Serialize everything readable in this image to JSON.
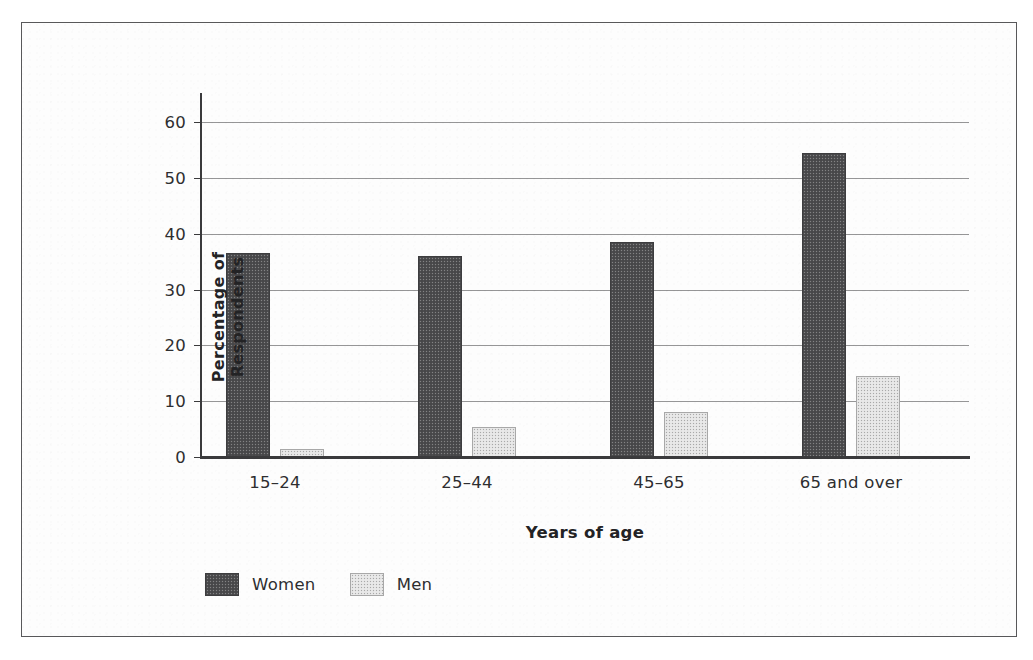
{
  "chart_data": {
    "type": "bar",
    "title": "",
    "subtitle": "",
    "xlabel": "Years of age",
    "ylabel": "Percentage of Respondents",
    "categories": [
      "15–24",
      "25–44",
      "45–65",
      "65 and over"
    ],
    "series": [
      {
        "name": "Women",
        "values": [
          36.5,
          36.0,
          38.5,
          54.5
        ],
        "color": "#4d4d4f"
      },
      {
        "name": "Men",
        "values": [
          1.5,
          5.3,
          8.0,
          14.5
        ],
        "color": "#e4e4e4"
      }
    ],
    "ylim": [
      0,
      60
    ],
    "yticks": [
      0,
      10,
      20,
      30,
      40,
      50,
      60
    ],
    "ytick_labels": [
      "0",
      "10",
      "20",
      "30",
      "40",
      "50",
      "60"
    ],
    "grid": "horizontal",
    "legend_position": "bottom-left",
    "legend": [
      {
        "label": "Women",
        "swatch": "dark-gray-halftone"
      },
      {
        "label": "Men",
        "swatch": "light-gray-halftone"
      }
    ],
    "frame": "outer-rectangle-border"
  }
}
